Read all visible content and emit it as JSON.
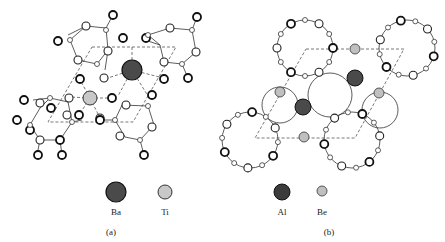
{
  "figure": {
    "panels": [
      {
        "id": "a",
        "caption": "(a)",
        "legend": [
          {
            "label": "Ba",
            "color": "#4a4a4a",
            "radius": 10
          },
          {
            "label": "Ti",
            "color": "#c8c8c8",
            "radius": 7
          }
        ]
      },
      {
        "id": "b",
        "caption": "(b)",
        "legend": [
          {
            "label": "Al",
            "color": "#3c3c3c",
            "radius": 8
          },
          {
            "label": "Be",
            "color": "#c0c0c0",
            "radius": 5
          }
        ]
      }
    ]
  }
}
